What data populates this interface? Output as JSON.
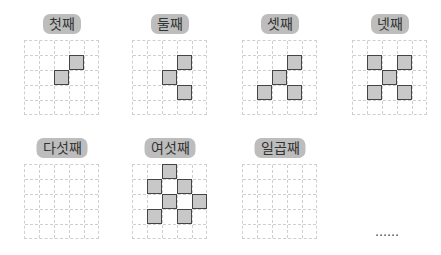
{
  "panels": [
    {
      "label": "첫째",
      "x": 24,
      "y": 14,
      "cells": [
        [
          3,
          1
        ],
        [
          2,
          2
        ]
      ]
    },
    {
      "label": "둘째",
      "x": 132,
      "y": 14,
      "cells": [
        [
          3,
          1
        ],
        [
          2,
          2
        ],
        [
          3,
          3
        ]
      ]
    },
    {
      "label": "셋째",
      "x": 242,
      "y": 14,
      "cells": [
        [
          3,
          1
        ],
        [
          2,
          2
        ],
        [
          1,
          3
        ],
        [
          3,
          3
        ]
      ]
    },
    {
      "label": "넷째",
      "x": 352,
      "y": 14,
      "cells": [
        [
          1,
          1
        ],
        [
          3,
          1
        ],
        [
          2,
          2
        ],
        [
          1,
          3
        ],
        [
          3,
          3
        ]
      ]
    },
    {
      "label": "다섯째",
      "x": 24,
      "y": 138,
      "cells": []
    },
    {
      "label": "여섯째",
      "x": 132,
      "y": 138,
      "cells": [
        [
          2,
          0
        ],
        [
          1,
          1
        ],
        [
          3,
          1
        ],
        [
          2,
          2
        ],
        [
          4,
          2
        ],
        [
          1,
          3
        ],
        [
          3,
          3
        ]
      ]
    },
    {
      "label": "일곱째",
      "x": 242,
      "y": 138,
      "cells": []
    }
  ],
  "continuation": "……",
  "grid": {
    "rows": 5,
    "cols": 5,
    "cell_px": 15
  },
  "colors": {
    "filled": "#c8c8c8",
    "border": "#444444",
    "label_bg": "#bdbdbd",
    "gridline": "#cfcfcf"
  }
}
